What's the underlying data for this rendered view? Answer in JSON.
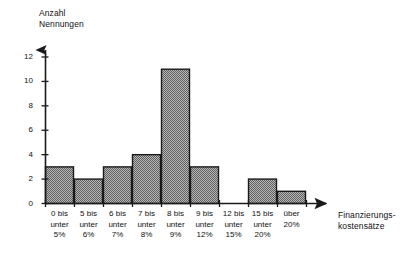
{
  "chart_data": {
    "type": "bar",
    "title": "",
    "subtitle": "",
    "ylabel": "Anzahl\nNennungen",
    "xlabel": "Finanzierungs-\nkostensätze",
    "categories": [
      "0 bis\nunter\n5%",
      "5 bis\nunter\n6%",
      "6 bis\nunter\n7%",
      "7 bis\nunter\n8%",
      "8 bis\nunter\n9%",
      "9 bis\nunter\n12%",
      "12 bis\nunter\n15%",
      "15 bis\nunter\n20%",
      "über\n20%"
    ],
    "values": [
      3,
      2,
      3,
      4,
      11,
      3,
      0,
      2,
      1
    ],
    "ylim": [
      0,
      12
    ],
    "yticks": [
      0,
      2,
      4,
      6,
      8,
      10,
      12
    ],
    "ytick_labels": [
      "0",
      "2",
      "4",
      "6",
      "8",
      "10",
      "12"
    ],
    "grid": false,
    "legend": null,
    "bar_fill": "#8a8a8a",
    "bar_stroke": "#1a1a1a",
    "axis_color": "#1a1a1a"
  }
}
